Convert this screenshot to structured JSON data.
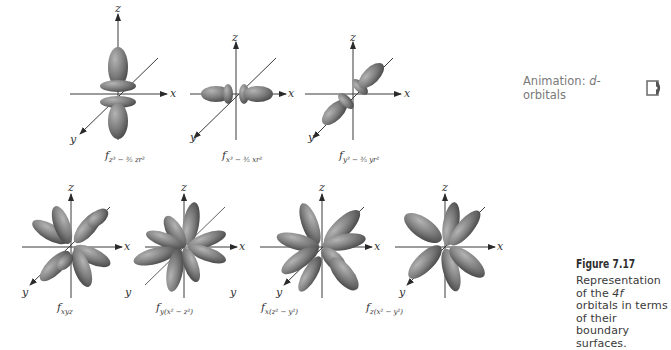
{
  "figure": {
    "number_label": "Figure 7.17",
    "caption": "Representation of the 4f orbitals in terms of their boundary surfaces.",
    "caption_parts": {
      "pre": "Representation of the ",
      "italic": "4f",
      "post": " orbitals in terms of their boundary surfaces."
    }
  },
  "animation": {
    "label_prefix": "Animation: ",
    "label_italic": "d",
    "label_suffix": "-orbitals",
    "icon": "cd-disc-icon"
  },
  "axes_labels": {
    "x": "x",
    "y": "y",
    "z": "z"
  },
  "orbitals_top": [
    {
      "id": "fz3",
      "label_main": "f",
      "label_sub": "z³ − ³⁄₅ zr²"
    },
    {
      "id": "fx3",
      "label_main": "f",
      "label_sub": "x³ − ³⁄₅ xr²"
    },
    {
      "id": "fy3",
      "label_main": "f",
      "label_sub": "y³ − ³⁄₅ yr²"
    }
  ],
  "orbitals_bottom": [
    {
      "id": "fxyz",
      "label_main": "f",
      "label_sub": "xyz"
    },
    {
      "id": "fyx2z2",
      "label_main": "f",
      "label_sub": "y(x² − z²)"
    },
    {
      "id": "fxz2y2",
      "label_main": "f",
      "label_sub": "x(z² − y²)"
    },
    {
      "id": "fzx2y2",
      "label_main": "f",
      "label_sub": "z(x² − y²)"
    }
  ],
  "colors": {
    "lobe": "#7d7d7d",
    "lobe_light": "#a9a9a9",
    "lobe_dark": "#4e4e4e",
    "axis": "#3a3a3a",
    "animation_text": "#7a7a7a"
  }
}
